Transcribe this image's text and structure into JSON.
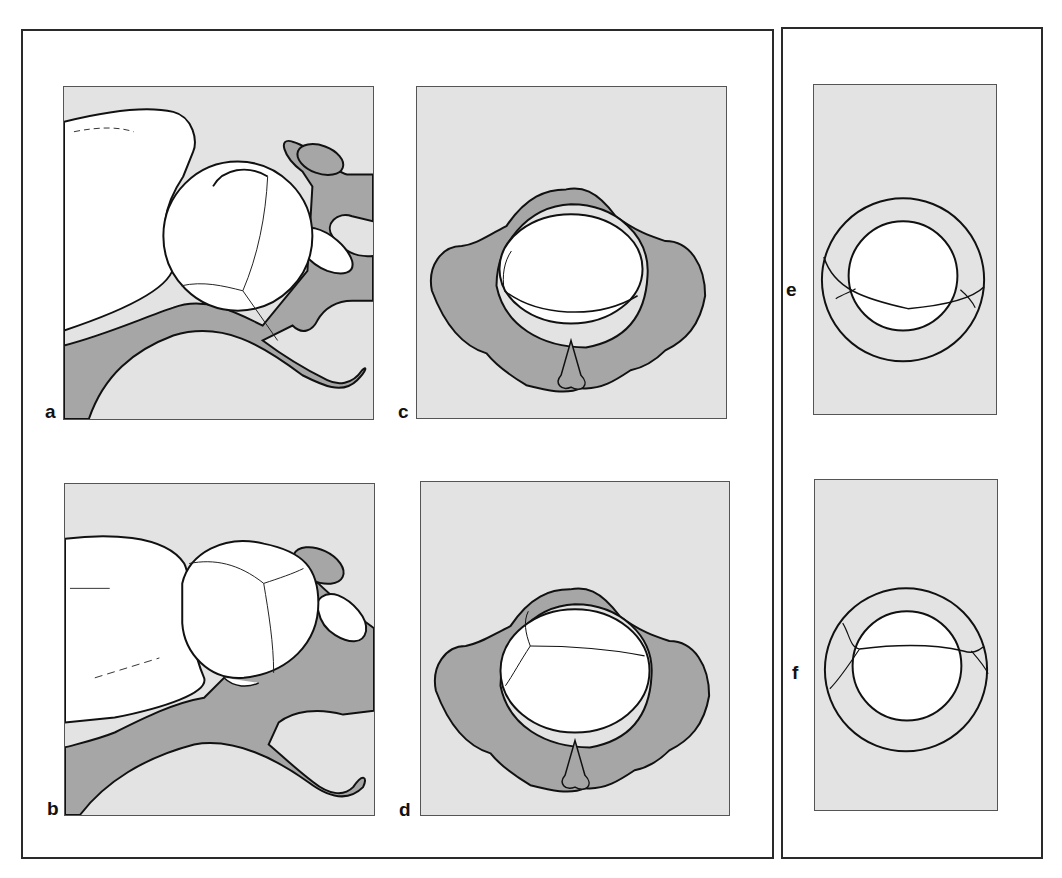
{
  "figure": {
    "colors": {
      "background": "#ffffff",
      "panel_fill": "#e3e3e3",
      "bone_fill": "#a6a6a6",
      "head_fill": "#ffffff",
      "outline": "#111111",
      "frame_border": "#2a2a2a"
    },
    "frames": [
      {
        "id": "left-frame",
        "panels": [
          "a",
          "b",
          "c",
          "d"
        ]
      },
      {
        "id": "right-frame",
        "panels": [
          "e",
          "f"
        ]
      }
    ],
    "panels": {
      "a": {
        "label": "a",
        "view": "lateral",
        "description": "fetal head in pelvis, lateral view, head flexed with fontanelle sutures"
      },
      "b": {
        "label": "b",
        "view": "lateral",
        "description": "fetal head in pelvis, lateral view, alternative head position"
      },
      "c": {
        "label": "c",
        "view": "inlet",
        "description": "pelvic inlet view from above with fetal head, sagittal suture transverse low"
      },
      "d": {
        "label": "d",
        "view": "inlet",
        "description": "pelvic inlet view from above with fetal head, sagittal suture transverse high"
      },
      "e": {
        "label": "e",
        "view": "schematic",
        "description": "schematic ring with inner circle, suture line below center"
      },
      "f": {
        "label": "f",
        "view": "schematic",
        "description": "schematic ring with inner circle, suture line above center"
      }
    }
  }
}
